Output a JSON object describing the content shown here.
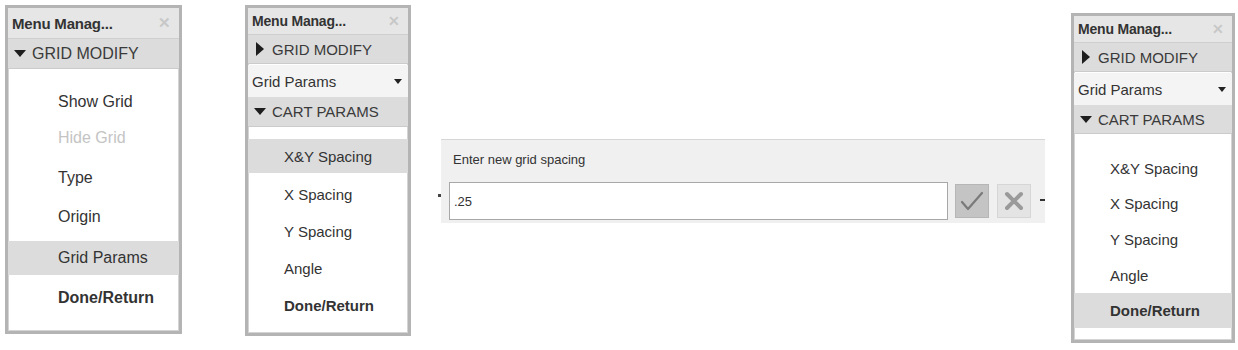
{
  "panels": [
    {
      "title": "Menu Manag...",
      "close_icon": "close-icon",
      "sections": [
        {
          "label": "GRID MODIFY",
          "state": "expanded"
        }
      ],
      "items": [
        {
          "label": "Show Grid",
          "state": "normal"
        },
        {
          "label": "Hide Grid",
          "state": "disabled"
        },
        {
          "label": "Type",
          "state": "normal"
        },
        {
          "label": "Origin",
          "state": "normal"
        },
        {
          "label": "Grid Params",
          "state": "highlighted"
        },
        {
          "label": "Done/Return",
          "state": "bold"
        }
      ]
    },
    {
      "title": "Menu Manag...",
      "close_icon": "close-icon",
      "sections": [
        {
          "label": "GRID MODIFY",
          "state": "collapsed"
        },
        {
          "label": "CART PARAMS",
          "state": "expanded"
        }
      ],
      "dropdown": {
        "value": "Grid Params"
      },
      "items": [
        {
          "label": "X&Y Spacing",
          "state": "highlighted"
        },
        {
          "label": "X Spacing",
          "state": "normal"
        },
        {
          "label": "Y Spacing",
          "state": "normal"
        },
        {
          "label": "Angle",
          "state": "normal"
        },
        {
          "label": "Done/Return",
          "state": "bold"
        }
      ]
    },
    {
      "title": "Menu Manag...",
      "close_icon": "close-icon",
      "sections": [
        {
          "label": "GRID MODIFY",
          "state": "collapsed"
        },
        {
          "label": "CART PARAMS",
          "state": "expanded"
        }
      ],
      "dropdown": {
        "value": "Grid Params"
      },
      "items": [
        {
          "label": "X&Y Spacing",
          "state": "normal"
        },
        {
          "label": "X Spacing",
          "state": "normal"
        },
        {
          "label": "Y Spacing",
          "state": "normal"
        },
        {
          "label": "Angle",
          "state": "normal"
        },
        {
          "label": "Done/Return",
          "state": "bold-highlighted"
        }
      ]
    }
  ],
  "dialog": {
    "prompt": "Enter new grid spacing",
    "input_value": ".25",
    "ok_icon": "checkmark-icon",
    "cancel_icon": "close-icon"
  },
  "colors": {
    "panel_border": "#b4b4b4",
    "header_bg": "#dcdcdc",
    "highlight_bg": "#dcdcdc",
    "disabled_text": "#c4c4c4",
    "ok_button_bg": "#c4c4c4",
    "check_color": "#7a7a7a"
  }
}
